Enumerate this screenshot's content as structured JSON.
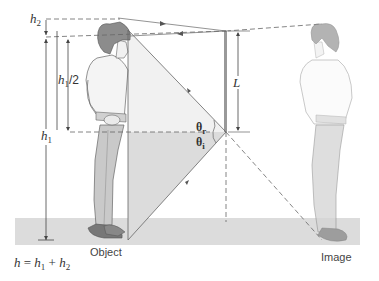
{
  "diagram": {
    "labels": {
      "h2": "h",
      "h2_sub": "2",
      "h1_half": "h",
      "h1_half_sub": "1",
      "h1_half_suffix": "/2",
      "h1": "h",
      "h1_sub": "1",
      "L": "L",
      "theta_r": "θ",
      "theta_r_sub": "r",
      "theta_i": "θ",
      "theta_i_sub": "i",
      "object": "Object",
      "image": "Image",
      "formula_h": "h",
      "formula_eq": " = ",
      "formula_h1": "h",
      "formula_h1_sub": "1",
      "formula_plus": " + ",
      "formula_h2": "h",
      "formula_h2_sub": "2"
    },
    "colors": {
      "floor": "#dcdcdc",
      "ray": "#777777",
      "mirror": "#888888",
      "hair": "#8a8a8a",
      "pants": "#c8c8c8",
      "shade_upper": "#f0f0f0",
      "shade_lower": "#dedede"
    }
  }
}
